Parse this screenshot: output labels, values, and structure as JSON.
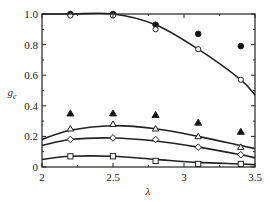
{
  "chart_data": {
    "type": "line",
    "title": "",
    "xlabel": "λ",
    "ylabel": "g_c",
    "xlim": [
      2,
      3.5
    ],
    "ylim": [
      0,
      1.0
    ],
    "grid": false,
    "legend": null,
    "x_ticks": [
      "2",
      "2.5",
      "3",
      "3.5"
    ],
    "y_ticks": [
      "0",
      "0.2",
      "0.4",
      "0.6",
      "0.8",
      "1.0"
    ],
    "x": [
      2.2,
      2.5,
      2.8,
      3.1,
      3.4
    ],
    "series": [
      {
        "name": "filled-circle",
        "marker": "filled-circle",
        "values": [
          1.0,
          1.0,
          0.93,
          0.87,
          0.79
        ]
      },
      {
        "name": "open-circle",
        "marker": "open-circle",
        "values": [
          0.99,
          0.99,
          0.9,
          0.77,
          0.57
        ]
      },
      {
        "name": "filled-triangle",
        "marker": "filled-triangle",
        "values": [
          0.35,
          0.35,
          0.34,
          0.29,
          0.23
        ]
      },
      {
        "name": "open-triangle",
        "marker": "open-triangle",
        "values": [
          0.25,
          0.28,
          0.25,
          0.2,
          0.13
        ]
      },
      {
        "name": "open-diamond",
        "marker": "open-diamond",
        "values": [
          0.18,
          0.19,
          0.18,
          0.13,
          0.08
        ]
      },
      {
        "name": "open-square",
        "marker": "open-square",
        "values": [
          0.07,
          0.07,
          0.04,
          0.02,
          0.02
        ]
      }
    ],
    "fit_curves": [
      {
        "name": "fit-circle",
        "x": [
          2.0,
          2.2,
          2.5,
          2.8,
          3.1,
          3.4,
          3.5
        ],
        "values": [
          1.0,
          1.0,
          1.0,
          0.93,
          0.77,
          0.57,
          0.47
        ]
      },
      {
        "name": "fit-triangle",
        "x": [
          2.0,
          2.2,
          2.5,
          2.8,
          3.1,
          3.4,
          3.5
        ],
        "values": [
          0.18,
          0.24,
          0.27,
          0.25,
          0.2,
          0.14,
          0.12
        ]
      },
      {
        "name": "fit-diamond",
        "x": [
          2.0,
          2.2,
          2.5,
          2.8,
          3.1,
          3.4,
          3.5
        ],
        "values": [
          0.14,
          0.18,
          0.19,
          0.17,
          0.13,
          0.08,
          0.06
        ]
      },
      {
        "name": "fit-square",
        "x": [
          2.0,
          2.2,
          2.5,
          2.8,
          3.1,
          3.4,
          3.5
        ],
        "values": [
          0.05,
          0.07,
          0.07,
          0.05,
          0.03,
          0.02,
          0.015
        ]
      }
    ]
  },
  "axes": {
    "xlabel": "λ",
    "ylabel_main": "g",
    "ylabel_sub": "c"
  }
}
